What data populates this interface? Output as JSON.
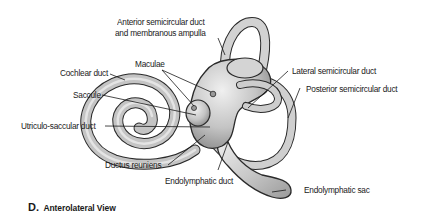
{
  "figure": {
    "panel_letter": "D.",
    "panel_title": "Anterolateral View"
  },
  "labels": {
    "anterior_duct_line1": "Anterior semicircular duct",
    "anterior_duct_line2": "and membranous ampulla",
    "maculae": "Maculae",
    "cochlear_duct": "Cochlear duct",
    "saccule": "Saccule",
    "lateral_duct": "Lateral semicircular duct",
    "posterior_duct": "Posterior semicircular duct",
    "utriculo_saccular_duct": "Utriculo-saccular duct",
    "ductus_reuniens": "Ductus reuniens",
    "endolymphatic_duct": "Endolymphatic duct",
    "endolymphatic_sac": "Endolymphatic sac"
  },
  "colors": {
    "structure_fill": "#c9c9c9",
    "structure_light": "#e6e6e6",
    "outline": "#2a2a2a",
    "text": "#1a1a1a"
  }
}
